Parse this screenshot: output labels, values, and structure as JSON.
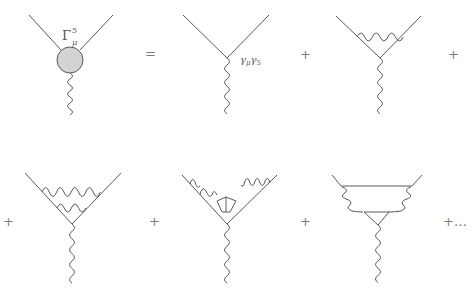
{
  "figure": {
    "colors": {
      "line": "#5a5a5a",
      "blob_fill": "#d3d3d3",
      "operator": "#7a7a7a"
    }
  },
  "labels": {
    "full_vertex_symbol": "Γ",
    "full_vertex_sup": "5",
    "full_vertex_sub": "μ",
    "tree_vertex_gamma1": "γ",
    "tree_vertex_mu": "μ",
    "tree_vertex_gamma2": "γ",
    "tree_vertex_five": "5"
  },
  "operators": {
    "equals": "=",
    "plus1": "+",
    "plus2": "+",
    "plus3": "+",
    "plus4": "+",
    "plus5": "+",
    "plus_ellipsis": "+…"
  },
  "diagrams": [
    {
      "id": "full-vertex",
      "description": "Blob vertex with two fermion legs and photon"
    },
    {
      "id": "tree-level",
      "description": "Bare vertex gamma_mu gamma_5"
    },
    {
      "id": "one-loop",
      "description": "One-loop vertex correction"
    },
    {
      "id": "two-loop-ladder",
      "description": "Two-loop ladder correction"
    },
    {
      "id": "two-loop-light-by-light",
      "description": "Two-loop with internal fermion loop"
    },
    {
      "id": "two-loop-triangle",
      "description": "Triangle anomaly subdiagram"
    }
  ]
}
